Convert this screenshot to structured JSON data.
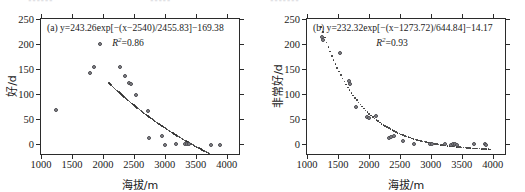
{
  "figure": {
    "top_remnant": [
      "▪▪▪▪▪▪",
      "▪▪▪▪▪",
      "▪▪▪▪▪▪▪"
    ]
  },
  "chart_data": [
    {
      "type": "scatter",
      "panel": "(a)",
      "title": "",
      "equation": "(a) y=243.26exp[−(x−2540)/2455.83]−169.38",
      "equation_parts": {
        "panel_label": "(a)",
        "y": "y",
        "amplitude": 243.26,
        "x_offset": 2540,
        "scale": 2455.83,
        "constant": -169.38,
        "form": "y=243.26exp[−(x−2540)/2455.83]−169.38"
      },
      "r_squared_label": "R",
      "r_squared_exp": "2",
      "r_squared_value": "=0.86",
      "r_squared": 0.86,
      "xlabel": "海拔/m",
      "ylabel": "好/d",
      "xlim": [
        1000,
        4200
      ],
      "ylim": [
        -20,
        250
      ],
      "xticks": [
        1000,
        1500,
        2000,
        2500,
        3000,
        3500,
        4000
      ],
      "yticks": [
        0,
        50,
        100,
        150,
        200,
        250
      ],
      "grid": false,
      "legend": "none",
      "points": [
        {
          "x": 1240,
          "y": 69
        },
        {
          "x": 1790,
          "y": 143
        },
        {
          "x": 1855,
          "y": 154
        },
        {
          "x": 1960,
          "y": 201
        },
        {
          "x": 2270,
          "y": 154
        },
        {
          "x": 2355,
          "y": 137
        },
        {
          "x": 2420,
          "y": 122
        },
        {
          "x": 2455,
          "y": 120
        },
        {
          "x": 2530,
          "y": 98
        },
        {
          "x": 2735,
          "y": 66
        },
        {
          "x": 2745,
          "y": 12
        },
        {
          "x": 2960,
          "y": 16
        },
        {
          "x": 3000,
          "y": -2
        },
        {
          "x": 3180,
          "y": 1
        },
        {
          "x": 3320,
          "y": 0
        },
        {
          "x": 3360,
          "y": 1
        },
        {
          "x": 3395,
          "y": 0
        },
        {
          "x": 3740,
          "y": -1
        },
        {
          "x": 3900,
          "y": -1
        }
      ],
      "fit_curve_x_range": [
        2100,
        3760
      ]
    },
    {
      "type": "scatter",
      "panel": "(b)",
      "title": "",
      "equation": "(b) y=232.32exp[−(x−1273.72)/644.84]−14.17",
      "equation_parts": {
        "panel_label": "(b)",
        "y": "y",
        "amplitude": 232.32,
        "x_offset": 1273.72,
        "scale": 644.84,
        "constant": -14.17,
        "form": "y=232.32exp[−(x−1273.72)/644.84]−14.17"
      },
      "r_squared_label": "R",
      "r_squared_exp": "2",
      "r_squared_value": "=0.93",
      "r_squared": 0.93,
      "xlabel": "海拔/m",
      "ylabel": "非常好/d",
      "xlim": [
        1000,
        4200
      ],
      "ylim": [
        -20,
        250
      ],
      "xticks": [
        1000,
        1500,
        2000,
        2500,
        3000,
        3500,
        4000
      ],
      "yticks": [
        0,
        50,
        100,
        150,
        200,
        250
      ],
      "grid": false,
      "legend": "none",
      "points": [
        {
          "x": 1240,
          "y": 215
        },
        {
          "x": 1255,
          "y": 209
        },
        {
          "x": 1530,
          "y": 182
        },
        {
          "x": 1680,
          "y": 126
        },
        {
          "x": 1700,
          "y": 120
        },
        {
          "x": 1790,
          "y": 75
        },
        {
          "x": 1975,
          "y": 54
        },
        {
          "x": 2000,
          "y": 52
        },
        {
          "x": 2110,
          "y": 57
        },
        {
          "x": 2320,
          "y": 13
        },
        {
          "x": 2360,
          "y": 14
        },
        {
          "x": 2400,
          "y": 16
        },
        {
          "x": 2545,
          "y": 7
        },
        {
          "x": 2730,
          "y": 0
        },
        {
          "x": 2990,
          "y": 0
        },
        {
          "x": 3020,
          "y": 0
        },
        {
          "x": 3230,
          "y": 0
        },
        {
          "x": 3320,
          "y": -2
        },
        {
          "x": 3360,
          "y": 0
        },
        {
          "x": 3390,
          "y": 0
        },
        {
          "x": 3420,
          "y": -1
        },
        {
          "x": 3700,
          "y": 0
        },
        {
          "x": 3870,
          "y": 0
        },
        {
          "x": 3900,
          "y": -2
        }
      ],
      "fit_curve_x_range": [
        1230,
        3960
      ]
    }
  ]
}
